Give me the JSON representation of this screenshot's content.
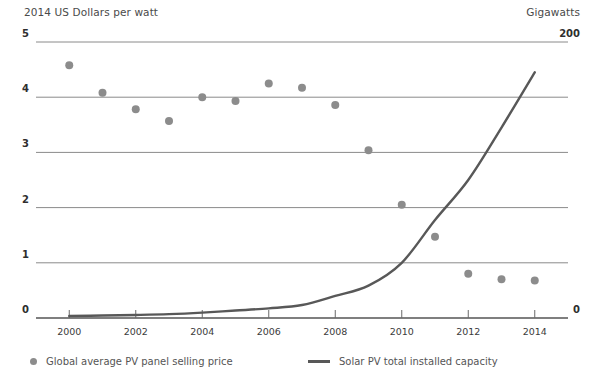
{
  "header": {
    "left_title": "2014 US Dollars per watt",
    "right_title": "Gigawatts"
  },
  "legend": {
    "scatter_label": "Global average PV panel selling price",
    "line_label": "Solar PV total installed capacity",
    "scatter_marker": "dot-marker-icon",
    "line_marker": "line-marker-icon",
    "scatter_color": "#8c8c8c",
    "line_color": "#585858"
  },
  "chart_data": {
    "type": "scatter",
    "title": "",
    "subtitle": "",
    "xlabel": "",
    "ylabel": "2014 US Dollars per watt",
    "y2label": "Gigawatts",
    "grid": true,
    "legend_position": "bottom",
    "x": [
      2000,
      2001,
      2002,
      2003,
      2004,
      2005,
      2006,
      2007,
      2008,
      2009,
      2010,
      2011,
      2012,
      2013,
      2014
    ],
    "xlim": [
      1999,
      2015
    ],
    "xticks": [
      2000,
      2002,
      2004,
      2006,
      2008,
      2010,
      2012,
      2014
    ],
    "xtick_labels": [
      "2000",
      "2002",
      "2004",
      "2006",
      "2008",
      "2010",
      "2012",
      "2014"
    ],
    "ylim": [
      0,
      5
    ],
    "yticks": [
      0,
      1,
      2,
      3,
      4,
      5
    ],
    "ytick_labels": [
      "0",
      "1",
      "2",
      "3",
      "4",
      "5"
    ],
    "y2lim": [
      0,
      200
    ],
    "y2ticks": [
      0,
      200
    ],
    "y2tick_labels": [
      "0",
      "200"
    ],
    "series": [
      {
        "name": "Global average PV panel selling price",
        "type": "scatter",
        "axis": "left",
        "units": "2014 US Dollars per watt",
        "color": "#8c8c8c",
        "values": [
          4.58,
          4.08,
          3.78,
          3.57,
          4.0,
          3.93,
          4.25,
          4.17,
          3.86,
          3.04,
          2.05,
          1.47,
          0.8,
          0.7,
          0.68
        ]
      },
      {
        "name": "Solar PV total installed capacity",
        "type": "line",
        "axis": "right",
        "units": "Gigawatts",
        "color": "#585858",
        "values": [
          1.4,
          1.8,
          2.2,
          2.8,
          3.9,
          5.4,
          7.0,
          9.4,
          16.0,
          23.5,
          40.0,
          71.0,
          100.0,
          138.0,
          178.0
        ]
      }
    ]
  }
}
